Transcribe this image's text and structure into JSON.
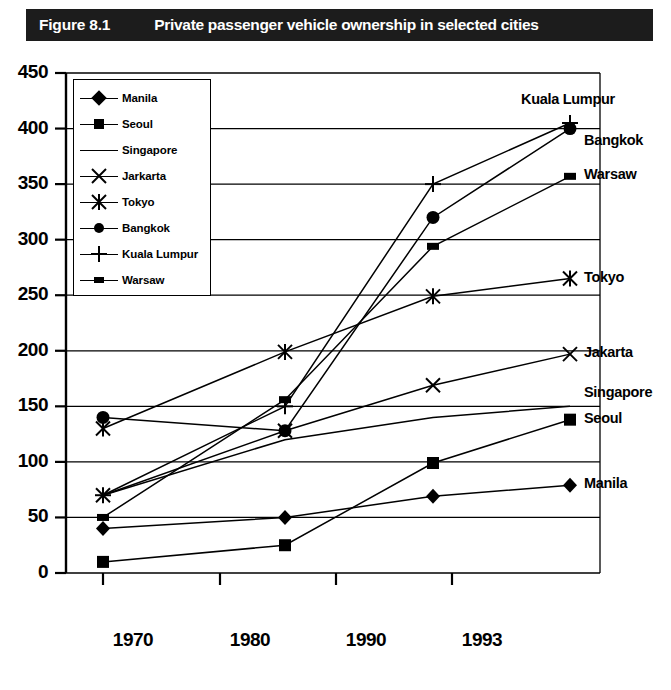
{
  "figure": {
    "number": "Figure 8.1",
    "title": "Private passenger vehicle ownership in selected cities"
  },
  "chart_data": {
    "type": "line",
    "title": "Private passenger vehicle ownership in selected cities",
    "xlabel": "",
    "ylabel": "",
    "x": [
      "1970",
      "1980",
      "1990",
      "1993"
    ],
    "xticklabels": [
      "1970",
      "1980",
      "1990",
      "1993"
    ],
    "yticklabels": [
      "0",
      "50",
      "100",
      "150",
      "200",
      "250",
      "300",
      "350",
      "400",
      "450"
    ],
    "ylim": [
      0,
      450
    ],
    "ytick_step": 50,
    "grid": "horizontal",
    "legend_position": "upper-left-inset",
    "series": [
      {
        "name": "Manila",
        "legend_label": "Manila",
        "end_label": "Manila",
        "marker": "diamond",
        "values": [
          40,
          50,
          69,
          79
        ]
      },
      {
        "name": "Seoul",
        "legend_label": "Seoul",
        "end_label": "Seoul",
        "marker": "square",
        "values": [
          10,
          25,
          99,
          138
        ]
      },
      {
        "name": "Singapore",
        "legend_label": "Singapore",
        "end_label": "Singapore",
        "marker": "none",
        "values": [
          70,
          120,
          140,
          150
        ]
      },
      {
        "name": "Jakarta",
        "legend_label": "Jarkarta",
        "end_label": "Jakarta",
        "marker": "x",
        "values": [
          70,
          128,
          169,
          197
        ]
      },
      {
        "name": "Tokyo",
        "legend_label": "Tokyo",
        "end_label": "Tokyo",
        "marker": "asterisk",
        "values": [
          130,
          199,
          249,
          265
        ]
      },
      {
        "name": "Bangkok",
        "legend_label": "Bangkok",
        "end_label": "Bangkok",
        "marker": "circle",
        "values": [
          140,
          128,
          320,
          400
        ]
      },
      {
        "name": "Kuala Lumpur",
        "legend_label": "Kuala Lumpur",
        "end_label": "Kuala Lumpur",
        "marker": "plus",
        "values": [
          70,
          150,
          350,
          405
        ]
      },
      {
        "name": "Warsaw",
        "legend_label": "Warsaw",
        "end_label": "Warsaw",
        "marker": "rect",
        "values": [
          50,
          156,
          294,
          357
        ]
      }
    ]
  },
  "colors": {
    "title_bar_background": "#1c1c1c",
    "title_text": "#ffffff",
    "plot_ink": "#000000",
    "page_background": "#ffffff"
  }
}
